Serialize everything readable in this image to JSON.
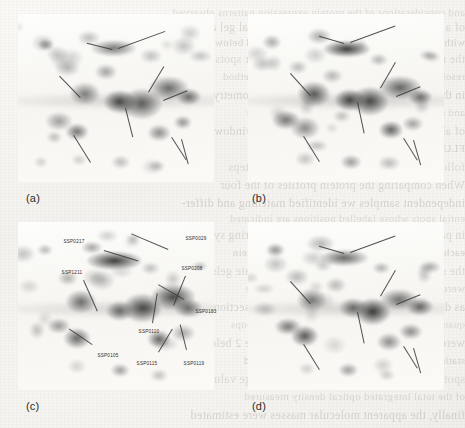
{
  "figure": {
    "type": "two-dimensional-gel-electrophoresis",
    "panel_count": 4,
    "background_color": "#f7f6f3",
    "spot_color": "#4a4a4a",
    "arrow_color": "#3a3a3a",
    "label_color": "#2c2c2c"
  },
  "panels": [
    {
      "id": "a",
      "label": "(a)",
      "label_x": 26,
      "label_y": 192
    },
    {
      "id": "b",
      "label": "(b)",
      "label_x": 252,
      "label_y": 192
    },
    {
      "id": "c",
      "label": "(c)",
      "label_x": 26,
      "label_y": 400
    },
    {
      "id": "d",
      "label": "(d)",
      "label_x": 252,
      "label_y": 400
    }
  ],
  "spot_labels": [
    {
      "text": "SSP0217",
      "x": 74,
      "y": 241,
      "lx": 104,
      "ly": 250,
      "angle": 17,
      "len": 36
    },
    {
      "text": "SSP0029",
      "x": 196,
      "y": 238,
      "lx": 168,
      "ly": 250,
      "angle": 203,
      "len": 40
    },
    {
      "text": "SSP1211",
      "x": 72,
      "y": 272,
      "lx": 84,
      "ly": 280,
      "angle": 66,
      "len": 34
    },
    {
      "text": "SSP0208",
      "x": 192,
      "y": 268,
      "lx": 186,
      "ly": 276,
      "angle": 112,
      "len": 32
    },
    {
      "text": "SSP0183",
      "x": 206,
      "y": 311,
      "lx": 184,
      "ly": 300,
      "angle": 210,
      "len": 30
    },
    {
      "text": "SSP0110",
      "x": 149,
      "y": 331,
      "lx": 152,
      "ly": 323,
      "angle": 279,
      "len": 30
    },
    {
      "text": "SSP0105",
      "x": 108,
      "y": 355,
      "lx": 92,
      "ly": 345,
      "angle": 214,
      "len": 28
    },
    {
      "text": "SSP0115",
      "x": 147,
      "y": 363,
      "lx": 158,
      "ly": 352,
      "angle": 301,
      "len": 27
    },
    {
      "text": "SSP0119",
      "x": 194,
      "y": 363,
      "lx": 186,
      "ly": 350,
      "angle": 256,
      "len": 26
    }
  ],
  "bleed_text": [
    {
      "y": 6,
      "x": 22,
      "size": 11,
      "text": "and considerations of the protein expression patterns observed"
    },
    {
      "y": 20,
      "x": 14,
      "size": 12,
      "text": "of a class of the proteins in two-dimensional gel analysis"
    },
    {
      "y": 36,
      "x": 30,
      "size": 11,
      "text": "with a distinct spot under the conditions tested below"
    },
    {
      "y": 52,
      "x": 18,
      "size": 12,
      "text": "the relative abundance of each of the major spots"
    },
    {
      "y": 70,
      "x": 26,
      "size": 11,
      "text": "resolved by the two-dimensional separation method"
    },
    {
      "y": 88,
      "x": 12,
      "size": 12,
      "text": "in the gels shown was quantified by densitometry"
    },
    {
      "y": 106,
      "x": 34,
      "size": 11,
      "text": "and normalized to the total integrated intensity"
    },
    {
      "y": 124,
      "x": 20,
      "size": 12,
      "text": "of all spots detected within the reference window"
    },
    {
      "y": 142,
      "x": 28,
      "size": 11,
      "text": "FLUORESCENCE"
    },
    {
      "y": 160,
      "x": 16,
      "size": 12,
      "text": "following staining and image acquisition steps"
    },
    {
      "y": 178,
      "x": 24,
      "size": 12,
      "text": "When comparing the protein profiles of the four"
    },
    {
      "y": 196,
      "x": 18,
      "size": 12,
      "text": "independent samples we identified matching and differ-"
    },
    {
      "y": 212,
      "x": 26,
      "size": 11,
      "text": "ential spots whose labelled positions are indicated"
    },
    {
      "y": 228,
      "x": 14,
      "size": 12,
      "text": "in panel (c) using the standard spot numbering system"
    },
    {
      "y": 246,
      "x": 30,
      "size": 11,
      "text": "each arrow marks a reproducibly detected protein"
    },
    {
      "y": 264,
      "x": 20,
      "size": 12,
      "text": "the same coordinates across all four replicate gels"
    },
    {
      "y": 282,
      "x": 26,
      "size": 11,
      "text": "were used to establish the spot correspondence"
    },
    {
      "y": 300,
      "x": 16,
      "size": 12,
      "text": "as described in the materials and methods section"
    },
    {
      "y": 318,
      "x": 28,
      "size": 11,
      "text": "quantitative differences between treatment groups"
    },
    {
      "y": 336,
      "x": 18,
      "size": 12,
      "text": "were assessed and are summarized in Table 2 below"
    },
    {
      "y": 354,
      "x": 24,
      "size": 11,
      "text": "statistically significant changes are highlighted"
    },
    {
      "y": 372,
      "x": 14,
      "size": 12,
      "text": "spot intensity was expressed as a percentage value"
    },
    {
      "y": 390,
      "x": 30,
      "size": 11,
      "text": "of the total integrated optical density measured"
    },
    {
      "y": 408,
      "x": 20,
      "size": 12,
      "text": "finally, the apparent molecular masses were estimated"
    }
  ],
  "gel_spots": {
    "description": "Protein spot intensity map shared by all four panels (relative coordinates 0-1)",
    "common": [
      {
        "x": 0.5,
        "y": 0.22,
        "rx": 26,
        "ry": 9,
        "i": 0.78
      },
      {
        "x": 0.33,
        "y": 0.47,
        "rx": 13,
        "ry": 10,
        "i": 0.66
      },
      {
        "x": 0.53,
        "y": 0.52,
        "rx": 14,
        "ry": 10,
        "i": 0.72
      },
      {
        "x": 0.63,
        "y": 0.52,
        "rx": 17,
        "ry": 13,
        "i": 0.82
      },
      {
        "x": 0.78,
        "y": 0.45,
        "rx": 19,
        "ry": 11,
        "i": 0.74
      },
      {
        "x": 0.88,
        "y": 0.5,
        "rx": 12,
        "ry": 8,
        "i": 0.55
      },
      {
        "x": 0.2,
        "y": 0.63,
        "rx": 12,
        "ry": 8,
        "i": 0.5
      },
      {
        "x": 0.3,
        "y": 0.69,
        "rx": 12,
        "ry": 9,
        "i": 0.6
      },
      {
        "x": 0.72,
        "y": 0.7,
        "rx": 12,
        "ry": 9,
        "i": 0.58
      },
      {
        "x": 0.84,
        "y": 0.66,
        "rx": 10,
        "ry": 7,
        "i": 0.42
      },
      {
        "x": 0.13,
        "y": 0.17,
        "rx": 8,
        "ry": 6,
        "i": 0.38
      },
      {
        "x": 0.37,
        "y": 0.14,
        "rx": 11,
        "ry": 7,
        "i": 0.34
      },
      {
        "x": 0.67,
        "y": 0.26,
        "rx": 9,
        "ry": 6,
        "i": 0.3
      },
      {
        "x": 0.44,
        "y": 0.36,
        "rx": 11,
        "ry": 8,
        "i": 0.33
      },
      {
        "x": 0.26,
        "y": 0.33,
        "rx": 10,
        "ry": 7,
        "i": 0.28
      },
      {
        "x": 0.52,
        "y": 0.88,
        "rx": 10,
        "ry": 7,
        "i": 0.36
      },
      {
        "x": 0.72,
        "y": 0.9,
        "rx": 9,
        "ry": 6,
        "i": 0.26
      },
      {
        "x": 0.3,
        "y": 0.87,
        "rx": 8,
        "ry": 6,
        "i": 0.22
      },
      {
        "x": 0.92,
        "y": 0.26,
        "rx": 9,
        "ry": 5,
        "i": 0.3
      }
    ],
    "band": {
      "x": 0.55,
      "y": 0.52,
      "rx": 120,
      "ry": 7,
      "i": 0.22
    }
  },
  "arrows": {
    "a": [
      {
        "x": 118,
        "y": 48,
        "angle": 340,
        "len": 50
      },
      {
        "x": 112,
        "y": 50,
        "angle": 194,
        "len": 26
      },
      {
        "x": 80,
        "y": 98,
        "angle": 226,
        "len": 30
      },
      {
        "x": 148,
        "y": 92,
        "angle": 301,
        "len": 30
      },
      {
        "x": 163,
        "y": 100,
        "angle": 338,
        "len": 26
      },
      {
        "x": 126,
        "y": 108,
        "angle": 76,
        "len": 30
      },
      {
        "x": 74,
        "y": 135,
        "angle": 58,
        "len": 32
      },
      {
        "x": 172,
        "y": 137,
        "angle": 57,
        "len": 27
      },
      {
        "x": 182,
        "y": 139,
        "angle": 75,
        "len": 26
      }
    ],
    "b": [
      {
        "x": 350,
        "y": 42,
        "angle": 340,
        "len": 48
      },
      {
        "x": 344,
        "y": 44,
        "angle": 196,
        "len": 26
      },
      {
        "x": 310,
        "y": 96,
        "angle": 228,
        "len": 30
      },
      {
        "x": 380,
        "y": 88,
        "angle": 300,
        "len": 30
      },
      {
        "x": 396,
        "y": 96,
        "angle": 338,
        "len": 26
      },
      {
        "x": 358,
        "y": 102,
        "angle": 78,
        "len": 32
      },
      {
        "x": 304,
        "y": 136,
        "angle": 58,
        "len": 30
      },
      {
        "x": 404,
        "y": 138,
        "angle": 58,
        "len": 26
      },
      {
        "x": 414,
        "y": 140,
        "angle": 74,
        "len": 26
      }
    ],
    "d": [
      {
        "x": 350,
        "y": 252,
        "angle": 340,
        "len": 48
      },
      {
        "x": 344,
        "y": 254,
        "angle": 196,
        "len": 26
      },
      {
        "x": 310,
        "y": 304,
        "angle": 228,
        "len": 30
      },
      {
        "x": 380,
        "y": 296,
        "angle": 300,
        "len": 30
      },
      {
        "x": 396,
        "y": 304,
        "angle": 338,
        "len": 26
      },
      {
        "x": 358,
        "y": 312,
        "angle": 78,
        "len": 32
      },
      {
        "x": 304,
        "y": 344,
        "angle": 58,
        "len": 30
      },
      {
        "x": 404,
        "y": 346,
        "angle": 58,
        "len": 26
      },
      {
        "x": 414,
        "y": 348,
        "angle": 74,
        "len": 26
      }
    ]
  },
  "panel_boxes": [
    {
      "id": "a",
      "x": 18,
      "y": 14,
      "w": 196,
      "h": 168
    },
    {
      "id": "b",
      "x": 248,
      "y": 14,
      "w": 196,
      "h": 168
    },
    {
      "id": "c",
      "x": 18,
      "y": 222,
      "w": 196,
      "h": 168
    },
    {
      "id": "d",
      "x": 248,
      "y": 222,
      "w": 196,
      "h": 168
    }
  ]
}
